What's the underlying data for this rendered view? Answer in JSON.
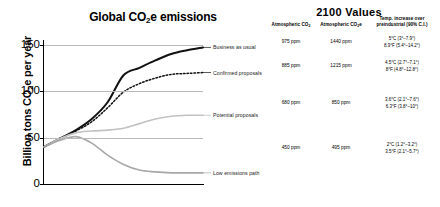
{
  "chart_data": {
    "type": "line",
    "title": "Global CO2e emissions",
    "title_parts": {
      "pre": "Global CO",
      "sub": "2",
      "post": "e emissions"
    },
    "xlabel": "",
    "ylabel": "Billion tons CO2e per year",
    "ylabel_parts": {
      "pre": "Billion tons CO",
      "sub": "2",
      "post": "e per year"
    },
    "x": [
      2000,
      2010,
      2020,
      2030,
      2040,
      2050,
      2060,
      2070,
      2080,
      2090,
      2100
    ],
    "xticks": [
      "2000",
      "2020",
      "2040",
      "2060",
      "2080",
      "2100"
    ],
    "xtick_values": [
      2000,
      2020,
      2040,
      2060,
      2080,
      2100
    ],
    "yticks": [
      "0",
      "50",
      "100",
      "150"
    ],
    "ytick_values": [
      0,
      50,
      100,
      150
    ],
    "xlim": [
      2000,
      2100
    ],
    "ylim": [
      0,
      155
    ],
    "grid": "horizontal",
    "legend_position": "right-inline",
    "series": [
      {
        "name": "Business as usual",
        "style": "solid-thick-black",
        "color": "#111111",
        "values": [
          40,
          49,
          58,
          70,
          88,
          117,
          125,
          133,
          140,
          144,
          147
        ]
      },
      {
        "name": "Confirmed proposals",
        "style": "dotted-black",
        "color": "#111111",
        "values": [
          40,
          49,
          57,
          67,
          82,
          99,
          108,
          114,
          118,
          119,
          120
        ]
      },
      {
        "name": "Potential proposals",
        "style": "solid-light-gray",
        "color": "#c2c2c2",
        "values": [
          40,
          49,
          55,
          57,
          58,
          60,
          65,
          70,
          73,
          74,
          74
        ]
      },
      {
        "name": "Low emissions path",
        "style": "solid-gray",
        "color": "#a8a8a8",
        "values": [
          40,
          47,
          51,
          44,
          31,
          21,
          15,
          13,
          12,
          12,
          12
        ]
      }
    ]
  },
  "table": {
    "title": "2100  Values",
    "columns": [
      {
        "key": "co2",
        "label_pre": "Atmospheric CO",
        "label_sub": "2",
        "label_post": ""
      },
      {
        "key": "co2e",
        "label_pre": "Atmospheric CO",
        "label_sub": "2",
        "label_post": "e"
      },
      {
        "key": "temp",
        "label_line1": "Temp. increase over",
        "label_line2": "preindustrial (90% C.I.)"
      }
    ],
    "rows": [
      {
        "scenario": "Business as usual",
        "co2": "975 ppm",
        "co2e": "1440 ppm",
        "temp_c": "5°C (3°–7.9°)",
        "temp_f": "8.9°F (5.4°–14.2°)"
      },
      {
        "scenario": "Confirmed proposals",
        "co2": "885 ppm",
        "co2e": "1215 ppm",
        "temp_c": "4.5°C (2.7°–7.1°)",
        "temp_f": "8°F (4.8°–12.8°)"
      },
      {
        "scenario": "Potential proposals",
        "co2": "680 ppm",
        "co2e": "850 ppm",
        "temp_c": "3.6°C (2.1°–7.6°)",
        "temp_f": "6.3°F (3.8°–10°)"
      },
      {
        "scenario": "Low emissions path",
        "co2": "450 ppm",
        "co2e": "495 ppm",
        "temp_c": "2°C (1.2°–3.2°)",
        "temp_f": "3.5°F (2.1°–5.7°)"
      }
    ]
  },
  "colors": {
    "axis": "#000000",
    "grid": "#b9b9b9",
    "business_as_usual": "#111111",
    "confirmed_proposals": "#111111",
    "potential_proposals": "#c2c2c2",
    "low_emissions_path": "#a8a8a8"
  }
}
